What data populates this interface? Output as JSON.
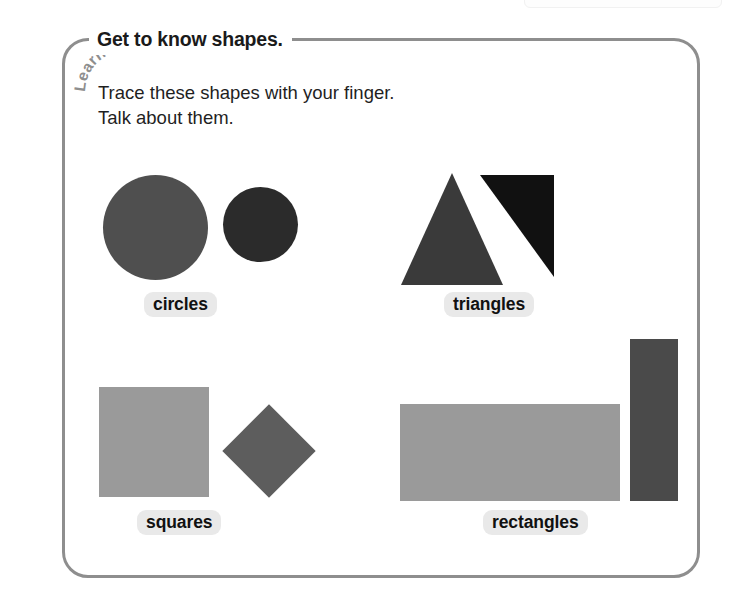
{
  "panel": {
    "tab_label": "Learn",
    "title": "Get to know shapes.",
    "instructions": [
      "Trace these shapes with your finger.",
      "Talk about them."
    ]
  },
  "colors": {
    "border": "#8e8e8e",
    "label_pill_bg": "#e9e9e9",
    "text": "#1a1a1a",
    "circle_large": "#4f4f4f",
    "circle_small": "#2b2b2b",
    "triangle_equilateral": "#3a3a3a",
    "triangle_right": "#111111",
    "square_large": "#9a9a9a",
    "square_diamond": "#5d5d5d",
    "rectangle_wide": "#9a9a9a",
    "rectangle_tall": "#4a4a4a"
  },
  "shape_groups": [
    {
      "id": "circles",
      "label": "circles",
      "shapes": [
        {
          "name": "large-circle",
          "kind": "circle",
          "color": "#4f4f4f",
          "size": 105
        },
        {
          "name": "small-circle",
          "kind": "circle",
          "color": "#2b2b2b",
          "size": 75
        }
      ]
    },
    {
      "id": "triangles",
      "label": "triangles",
      "shapes": [
        {
          "name": "equilateral-triangle",
          "kind": "triangle",
          "color": "#3a3a3a",
          "width": 100,
          "height": 110
        },
        {
          "name": "right-triangle",
          "kind": "right-triangle",
          "color": "#111111",
          "width": 72,
          "height": 100
        }
      ]
    },
    {
      "id": "squares",
      "label": "squares",
      "shapes": [
        {
          "name": "large-square",
          "kind": "square",
          "color": "#9a9a9a",
          "size": 110
        },
        {
          "name": "diamond-square",
          "kind": "square-rotated",
          "color": "#5d5d5d",
          "size": 66
        }
      ]
    },
    {
      "id": "rectangles",
      "label": "rectangles",
      "shapes": [
        {
          "name": "wide-rectangle",
          "kind": "rectangle",
          "color": "#9a9a9a",
          "width": 220,
          "height": 97
        },
        {
          "name": "tall-rectangle",
          "kind": "rectangle",
          "color": "#4a4a4a",
          "width": 48,
          "height": 162
        }
      ]
    }
  ]
}
